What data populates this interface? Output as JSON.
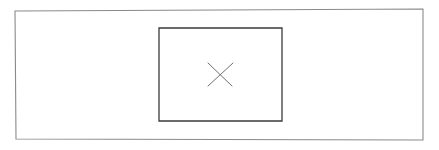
{
  "document": {
    "type": "line-drawing",
    "title": "Nested rectangles with X mark",
    "width": 439,
    "height": 150,
    "background_color": "#ffffff",
    "text_content": "",
    "annotations": []
  },
  "shapes": {
    "outer_rectangle": {
      "name": "outer-frame",
      "stroke_color": "#8a8a8a",
      "stroke_width": 1.1,
      "fill": "none",
      "corners": {
        "top_left": {
          "x": 15,
          "y": 11
        },
        "top_right": {
          "x": 423,
          "y": 9
        },
        "bottom_right": {
          "x": 423,
          "y": 140
        },
        "bottom_left": {
          "x": 16,
          "y": 139
        }
      }
    },
    "inner_rectangle": {
      "name": "inner-box",
      "stroke_color": "#3a3a3a",
      "stroke_width": 1.3,
      "fill": "none",
      "corners": {
        "top_left": {
          "x": 159,
          "y": 28
        },
        "top_right": {
          "x": 282,
          "y": 28
        },
        "bottom_right": {
          "x": 282,
          "y": 121
        },
        "bottom_left": {
          "x": 159,
          "y": 121
        }
      }
    },
    "x_mark": {
      "name": "x-mark",
      "stroke_color": "#6f6f6f",
      "stroke_width": 1.0,
      "center": {
        "x": 220,
        "y": 74
      },
      "stroke_1": {
        "x1": 208,
        "y1": 63,
        "x2": 232,
        "y2": 86
      },
      "stroke_2": {
        "x1": 233,
        "y1": 63,
        "x2": 208,
        "y2": 86
      }
    }
  }
}
